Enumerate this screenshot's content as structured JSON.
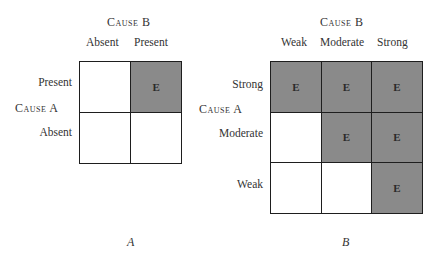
{
  "panels": [
    {
      "id": "A",
      "panel_label": "A",
      "column_axis_title": "Cause B",
      "row_axis_title": "Cause A",
      "columns": [
        "Absent",
        "Present"
      ],
      "rows": [
        "Present",
        "Absent"
      ],
      "cells": [
        [
          {
            "effect": false,
            "text": ""
          },
          {
            "effect": true,
            "text": "E"
          }
        ],
        [
          {
            "effect": false,
            "text": ""
          },
          {
            "effect": false,
            "text": ""
          }
        ]
      ]
    },
    {
      "id": "B",
      "panel_label": "B",
      "column_axis_title": "Cause B",
      "row_axis_title": "Cause A",
      "columns": [
        "Weak",
        "Moderate",
        "Strong"
      ],
      "rows": [
        "Strong",
        "Moderate",
        "Weak"
      ],
      "cells": [
        [
          {
            "effect": true,
            "text": "E"
          },
          {
            "effect": true,
            "text": "E"
          },
          {
            "effect": true,
            "text": "E"
          }
        ],
        [
          {
            "effect": false,
            "text": ""
          },
          {
            "effect": true,
            "text": "E"
          },
          {
            "effect": true,
            "text": "E"
          }
        ],
        [
          {
            "effect": false,
            "text": ""
          },
          {
            "effect": false,
            "text": ""
          },
          {
            "effect": true,
            "text": "E"
          }
        ]
      ]
    }
  ],
  "colors": {
    "effect_fill": "#8a8a8a",
    "empty_fill": "#ffffff",
    "grid_line": "#1e1e1e"
  }
}
